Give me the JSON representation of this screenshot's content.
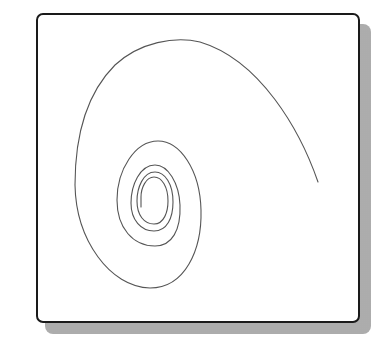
{
  "figure": {
    "type": "spiral-curve-diagram",
    "colors": {
      "frame_border": "#1a1a1a",
      "curve": "#555555",
      "shadow": "#b8b8b8",
      "background": "#ffffff"
    },
    "curve": {
      "start_point": [
        318,
        182
      ],
      "end_point": [
        141,
        207
      ],
      "turns": 4
    }
  }
}
